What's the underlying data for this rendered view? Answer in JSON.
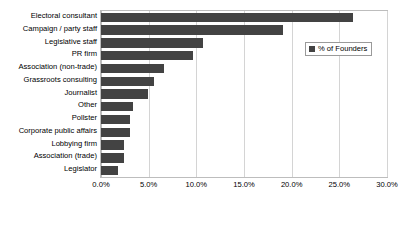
{
  "chart_data": {
    "type": "bar",
    "orientation": "horizontal",
    "title": "",
    "xlabel": "",
    "ylabel": "",
    "xlim": [
      0,
      30
    ],
    "xticks": [
      "0.0%",
      "5.0%",
      "10.0%",
      "15.0%",
      "20.0%",
      "25.0%",
      "30.0%"
    ],
    "xtick_values": [
      0,
      5,
      10,
      15,
      20,
      25,
      30
    ],
    "grid": true,
    "legend": {
      "position": "upper-right-inside",
      "entries": [
        {
          "label": "% of Founders",
          "color": "#434343"
        }
      ]
    },
    "categories": [
      "Electoral consultant",
      "Campaign / party staff",
      "Legislative staff",
      "PR firm",
      "Association (non-trade)",
      "Grassroots consulting",
      "Journalist",
      "Other",
      "Pollster",
      "Corporate public affairs",
      "Lobbying firm",
      "Association (trade)",
      "Legislator"
    ],
    "series": [
      {
        "name": "% of Founders",
        "color": "#434343",
        "values": [
          26.4,
          19.1,
          10.7,
          9.6,
          6.6,
          5.6,
          4.9,
          3.4,
          3.0,
          3.0,
          2.4,
          2.4,
          1.8
        ]
      }
    ]
  }
}
